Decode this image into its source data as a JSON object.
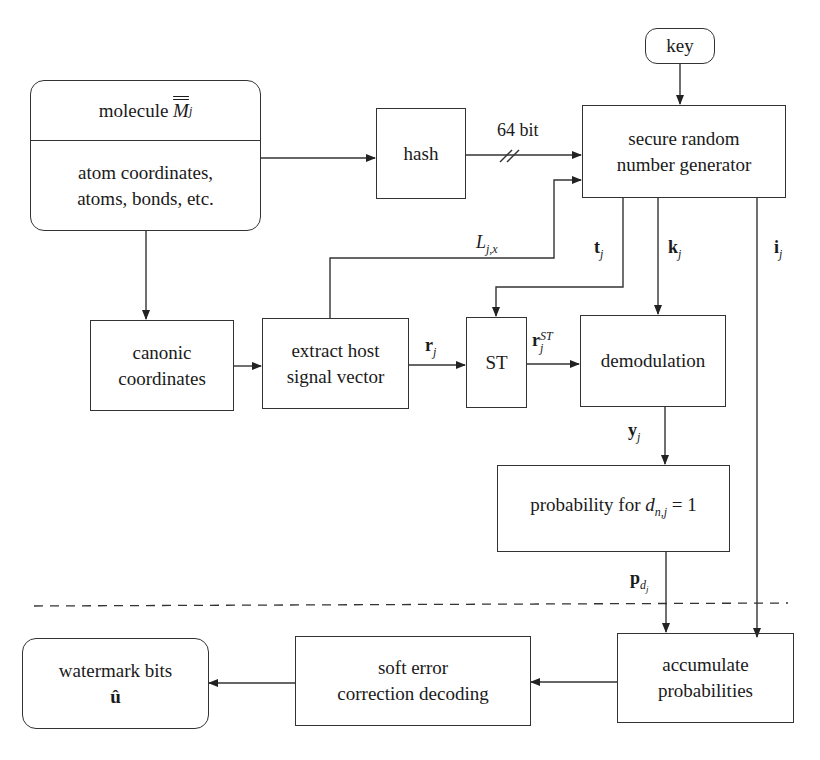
{
  "diagram": {
    "nodes": {
      "molecule": {
        "title_prefix": "molecule",
        "title_symbol": "M",
        "title_sub": "j",
        "body_line1": "atom coordinates,",
        "body_line2": "atoms, bonds, etc."
      },
      "hash": {
        "label": "hash"
      },
      "key": {
        "label": "key"
      },
      "srng": {
        "line1": "secure random",
        "line2": "number generator"
      },
      "canonic": {
        "line1": "canonic",
        "line2": "coordinates"
      },
      "extract": {
        "line1": "extract host",
        "line2": "signal vector"
      },
      "st": {
        "label": "ST"
      },
      "demod": {
        "label": "demodulation"
      },
      "probability": {
        "prefix": "probability for ",
        "var": "d",
        "sub": "n,j",
        "suffix": " = 1"
      },
      "accumulate": {
        "line1": "accumulate",
        "line2": "probabilities"
      },
      "softerr": {
        "line1": "soft error",
        "line2": "correction decoding"
      },
      "watermark": {
        "line1": "watermark bits",
        "line2": "û"
      }
    },
    "edge_labels": {
      "bits": "64 bit",
      "L": {
        "base": "L",
        "sub": "j,x"
      },
      "t": {
        "base": "t",
        "sub": "j"
      },
      "k": {
        "base": "k",
        "sub": "j"
      },
      "i": {
        "base": "i",
        "sub": "j"
      },
      "r": {
        "base": "r",
        "sub": "j"
      },
      "rst": {
        "base": "r",
        "sub": "j",
        "sup": "ST"
      },
      "y": {
        "base": "y",
        "sub": "j"
      },
      "p": {
        "base": "p",
        "sub": "d",
        "subsub": "j"
      }
    }
  }
}
